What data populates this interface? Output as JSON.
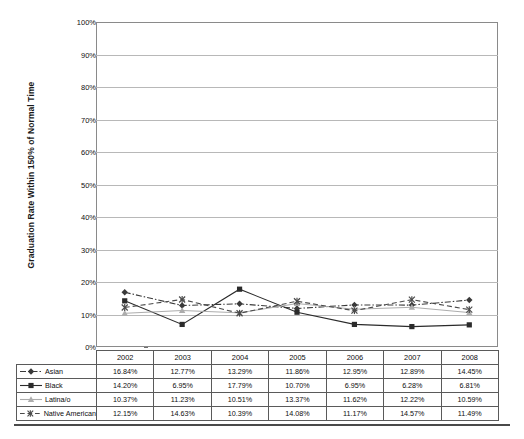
{
  "chart_data": {
    "type": "line",
    "title": "",
    "xlabel": "",
    "ylabel": "Graduation Rate Within 150% of Normal Time",
    "ylim": [
      0,
      100
    ],
    "yticks": [
      "0%",
      "10%",
      "20%",
      "30%",
      "40%",
      "50%",
      "60%",
      "70%",
      "80%",
      "90%",
      "100%"
    ],
    "ytick_values": [
      0,
      10,
      20,
      30,
      40,
      50,
      60,
      70,
      80,
      90,
      100
    ],
    "grid": true,
    "legend_position": "table-below",
    "categories": [
      "2002",
      "2003",
      "2004",
      "2005",
      "2006",
      "2007",
      "2008"
    ],
    "series": [
      {
        "name": "Asian",
        "marker": "diamond",
        "line_style": "dash-dot",
        "color": "#3a3a3a",
        "values": [
          16.84,
          12.77,
          13.29,
          11.86,
          12.95,
          12.89,
          14.45
        ],
        "labels": [
          "16.84%",
          "12.77%",
          "13.29%",
          "11.86%",
          "12.95%",
          "12.89%",
          "14.45%"
        ]
      },
      {
        "name": "Black",
        "marker": "square",
        "line_style": "solid",
        "color": "#2b2b2b",
        "values": [
          14.2,
          6.95,
          17.79,
          10.7,
          6.95,
          6.28,
          6.81
        ],
        "labels": [
          "14.20%",
          "6.95%",
          "17.79%",
          "10.70%",
          "6.95%",
          "6.28%",
          "6.81%"
        ]
      },
      {
        "name": "Latina/o",
        "marker": "triangle",
        "line_style": "solid-light",
        "color": "#adadad",
        "values": [
          10.37,
          11.23,
          10.51,
          13.37,
          11.62,
          12.22,
          10.59
        ],
        "labels": [
          "10.37%",
          "11.23%",
          "10.51%",
          "13.37%",
          "11.62%",
          "12.22%",
          "10.59%"
        ]
      },
      {
        "name": "Native American",
        "marker": "x",
        "line_style": "dashed",
        "color": "#4a4a4a",
        "values": [
          12.15,
          14.63,
          10.39,
          14.08,
          11.17,
          14.57,
          11.49
        ],
        "labels": [
          "12.15%",
          "14.63%",
          "10.39%",
          "14.08%",
          "11.17%",
          "14.57%",
          "11.49%"
        ]
      }
    ]
  },
  "table": {
    "corner_label": "",
    "column_headers": [
      "2002",
      "2003",
      "2004",
      "2005",
      "2006",
      "2007",
      "2008"
    ],
    "rows": [
      {
        "label": "Asian",
        "values": [
          "16.84%",
          "12.77%",
          "13.29%",
          "11.86%",
          "12.95%",
          "12.89%",
          "14.45%"
        ]
      },
      {
        "label": "Black",
        "values": [
          "14.20%",
          "6.95%",
          "17.79%",
          "10.70%",
          "6.95%",
          "6.28%",
          "6.81%"
        ]
      },
      {
        "label": "Latina/o",
        "values": [
          "10.37%",
          "11.23%",
          "10.51%",
          "13.37%",
          "11.62%",
          "12.22%",
          "10.59%"
        ]
      },
      {
        "label": "Native American",
        "values": [
          "12.15%",
          "14.63%",
          "10.39%",
          "14.08%",
          "11.17%",
          "14.57%",
          "11.49%"
        ]
      }
    ]
  },
  "colors": {
    "axis": "#8a8a8a",
    "grid": "#b8b8b8",
    "table_border": "#5a5a5a",
    "rule": "#4a4a4a",
    "background": "#ffffff"
  }
}
